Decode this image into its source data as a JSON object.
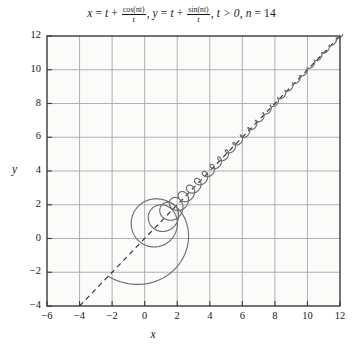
{
  "figure": {
    "title_parts": {
      "x_lhs": "x",
      "eq1": " = ",
      "t1": "t",
      "plus1": " + ",
      "frac1_num": "cos(nt)",
      "frac1_den": "t",
      "comma1": ", ",
      "y_lhs": "y",
      "eq2": " = ",
      "t2": "t",
      "plus2": " + ",
      "frac2_num": "sin(nt)",
      "frac2_den": "t",
      "comma2": ", ",
      "cond": "t > 0",
      "comma3": ", ",
      "n_label": "n",
      "n_eq": " = ",
      "n_value": "14"
    },
    "title_plain": "x = t + cos(nt)/t, y = t + sin(nt)/t, t > 0, n = 14",
    "xlabel": "x",
    "ylabel": "y",
    "colors": {
      "curve": "#6e6e6e",
      "asymptote": "#2b2b2b",
      "grid": "#a8a8a8",
      "frame": "#3a3a3a",
      "background": "#fbfbfa",
      "text": "#161616"
    }
  },
  "chart_data": {
    "type": "line",
    "xlabel": "x",
    "ylabel": "y",
    "xlim": [
      -6,
      12
    ],
    "ylim": [
      -4,
      12
    ],
    "xticks": [
      -6,
      -4,
      -2,
      0,
      2,
      4,
      6,
      8,
      10,
      12
    ],
    "yticks": [
      -4,
      -2,
      0,
      2,
      4,
      6,
      8,
      10,
      12
    ],
    "xtick_labels": [
      "−6",
      "−4",
      "−2",
      "0",
      "2",
      "4",
      "6",
      "8",
      "10",
      "12"
    ],
    "ytick_labels": [
      "−4",
      "−2",
      "0",
      "2",
      "4",
      "6",
      "8",
      "10",
      "12"
    ],
    "grid": true,
    "legend": "none",
    "parameters": {
      "n": 14,
      "t_min": 0.28,
      "t_max": 12.2
    },
    "series": [
      {
        "name": "parametric-spiral",
        "type": "parametric",
        "x_expr": "t + cos(n*t)/t",
        "y_expr": "t + sin(n*t)/t",
        "style": "solid",
        "color": "#6e6e6e",
        "width": 1.15,
        "description": "Spiral that winds inward with shrinking loops and converges onto the line y = x as t increases."
      },
      {
        "name": "asymptote y = x",
        "type": "line",
        "x": [
          -4,
          12
        ],
        "y": [
          -4,
          12
        ],
        "style": "dashed",
        "color": "#2b2b2b",
        "width": 1.1,
        "description": "Dashed diagonal asymptote from (-4,-4) to (12,12)."
      }
    ],
    "annotations": [
      {
        "text": "curve approaches y = x as t → ∞",
        "visible": false
      }
    ]
  }
}
